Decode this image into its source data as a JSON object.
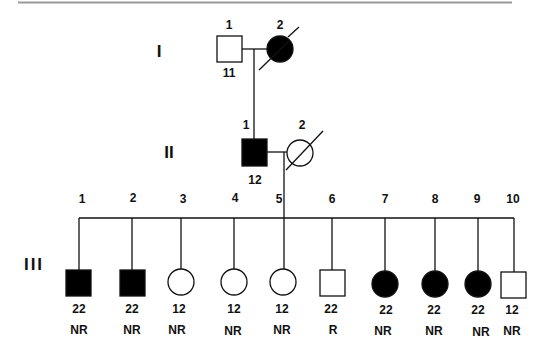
{
  "figure": {
    "type": "pedigree",
    "generation_labels": [
      "I",
      "II",
      "III"
    ]
  },
  "colors": {
    "affected": "#000000",
    "unaffected": "#ffffff",
    "line": "#111111",
    "top_rule": "#999999"
  },
  "generations": [
    {
      "label": "I",
      "members": [
        {
          "id": "1",
          "sex": "male",
          "affected": false,
          "deceased": false,
          "below": "11",
          "status": ""
        },
        {
          "id": "2",
          "sex": "female",
          "affected": true,
          "deceased": true,
          "below": "",
          "status": ""
        }
      ]
    },
    {
      "label": "II",
      "members": [
        {
          "id": "1",
          "sex": "male",
          "affected": true,
          "deceased": false,
          "below": "12",
          "status": ""
        },
        {
          "id": "2",
          "sex": "female",
          "affected": false,
          "deceased": true,
          "below": "",
          "status": ""
        }
      ]
    },
    {
      "label": "III",
      "members": [
        {
          "id": "1",
          "sex": "male",
          "affected": true,
          "deceased": false,
          "below": "22",
          "status": "NR"
        },
        {
          "id": "2",
          "sex": "male",
          "affected": true,
          "deceased": false,
          "below": "22",
          "status": "NR"
        },
        {
          "id": "3",
          "sex": "female",
          "affected": false,
          "deceased": false,
          "below": "12",
          "status": "NR"
        },
        {
          "id": "4",
          "sex": "female",
          "affected": false,
          "deceased": false,
          "below": "12",
          "status": "NR"
        },
        {
          "id": "5",
          "sex": "female",
          "affected": false,
          "deceased": false,
          "below": "12",
          "status": "NR"
        },
        {
          "id": "6",
          "sex": "male",
          "affected": false,
          "deceased": false,
          "below": "22",
          "status": "R"
        },
        {
          "id": "7",
          "sex": "female",
          "affected": true,
          "deceased": false,
          "below": "22",
          "status": "NR"
        },
        {
          "id": "8",
          "sex": "female",
          "affected": true,
          "deceased": false,
          "below": "22",
          "status": "NR"
        },
        {
          "id": "9",
          "sex": "female",
          "affected": true,
          "deceased": false,
          "below": "22",
          "status": "NR"
        },
        {
          "id": "10",
          "sex": "male",
          "affected": false,
          "deceased": false,
          "below": "12",
          "status": "NR"
        }
      ]
    }
  ]
}
